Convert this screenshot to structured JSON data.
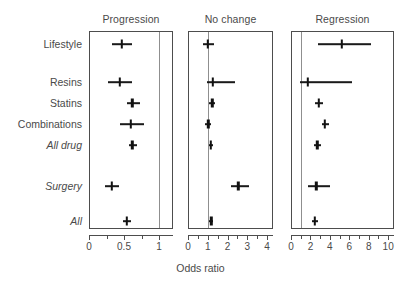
{
  "figure": {
    "axis_title": "Odds ratio"
  },
  "panels": [
    {
      "title": "Progression",
      "xmin": 0,
      "xmax": 1.2,
      "ref": 1,
      "ticks": [
        0,
        0.25,
        0.5,
        0.75,
        1
      ],
      "tick_labels": [
        "0",
        "",
        "0.5",
        "",
        "1"
      ]
    },
    {
      "title": "No change",
      "xmin": 0,
      "xmax": 4.3,
      "ref": 1,
      "ticks": [
        0,
        0.5,
        1,
        1.5,
        2,
        2.5,
        3,
        3.5,
        4
      ],
      "tick_labels": [
        "0",
        "",
        "1",
        "",
        "2",
        "",
        "3",
        "",
        "4"
      ]
    },
    {
      "title": "Regression",
      "xmin": 0,
      "xmax": 10.6,
      "ref": 1,
      "ticks": [
        0,
        1,
        2,
        3,
        4,
        5,
        6,
        7,
        8,
        9,
        10
      ],
      "tick_labels": [
        "0",
        "",
        "2",
        "",
        "4",
        "",
        "6",
        "",
        "8",
        "",
        "10"
      ]
    }
  ],
  "rows": [
    {
      "label": "Lifestyle",
      "italic": false
    },
    {
      "label": "Resins",
      "italic": false
    },
    {
      "label": "Statins",
      "italic": false
    },
    {
      "label": "Combinations",
      "italic": false
    },
    {
      "label": "All drug",
      "italic": true
    },
    {
      "label": "Surgery",
      "italic": true
    },
    {
      "label": "All",
      "italic": true
    }
  ],
  "chart_data": {
    "type": "forest",
    "title": "",
    "xlabel": "Odds ratio",
    "ylabel": "",
    "grid": false,
    "legend": "none",
    "reference_line": 1,
    "panels": [
      "Progression",
      "No change",
      "Regression"
    ],
    "categories": [
      "Lifestyle",
      "Resins",
      "Statins",
      "Combinations",
      "All drug",
      "Surgery",
      "All"
    ],
    "series": [
      {
        "name": "Progression",
        "xlim": [
          0,
          1.2
        ],
        "xticks": [
          0,
          0.5,
          1
        ],
        "estimates": [
          0.47,
          0.44,
          0.62,
          0.6,
          0.62,
          0.33,
          0.54
        ],
        "ci_low": [
          0.33,
          0.27,
          0.54,
          0.44,
          0.57,
          0.23,
          0.49
        ],
        "ci_high": [
          0.62,
          0.62,
          0.73,
          0.78,
          0.68,
          0.43,
          0.6
        ]
      },
      {
        "name": "No change",
        "xlim": [
          0,
          4.3
        ],
        "xticks": [
          0,
          1,
          2,
          3,
          4
        ],
        "estimates": [
          0.99,
          1.24,
          1.22,
          1.02,
          1.16,
          2.55,
          1.17
        ],
        "ci_low": [
          0.75,
          0.96,
          1.08,
          0.85,
          1.07,
          2.2,
          1.08
        ],
        "ci_high": [
          1.3,
          2.4,
          1.38,
          1.18,
          1.27,
          3.1,
          1.27
        ]
      },
      {
        "name": "Regression",
        "xlim": [
          0,
          10.6
        ],
        "xticks": [
          0,
          2,
          4,
          6,
          8,
          10
        ],
        "estimates": [
          5.2,
          1.7,
          2.85,
          3.5,
          2.7,
          2.6,
          2.45
        ],
        "ci_low": [
          2.8,
          0.95,
          2.45,
          3.2,
          2.35,
          1.7,
          2.15
        ],
        "ci_high": [
          8.2,
          6.3,
          3.3,
          3.95,
          3.05,
          4.0,
          2.8
        ]
      }
    ]
  }
}
